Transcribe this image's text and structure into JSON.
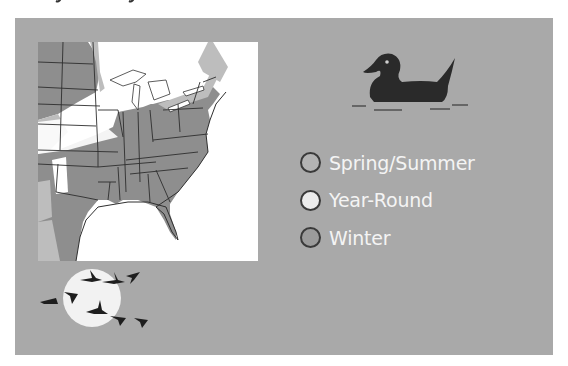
{
  "legend": {
    "items": [
      {
        "label": "Spring/Summer",
        "color": "#b3b3b3"
      },
      {
        "label": "Year-Round",
        "color": "#ececec"
      },
      {
        "label": "Winter",
        "color": "#9b9b9b"
      }
    ]
  },
  "colors": {
    "panel": "#a9a9a9",
    "map_winter": "#8e8e8e",
    "map_summer": "#bdbdbd",
    "map_water": "#ffffff",
    "silhouette": "#2a2a2a",
    "moon": "#f2f2f2"
  },
  "icons": {
    "duck": "duck-silhouette-icon",
    "geese": "geese-over-moon-icon"
  }
}
